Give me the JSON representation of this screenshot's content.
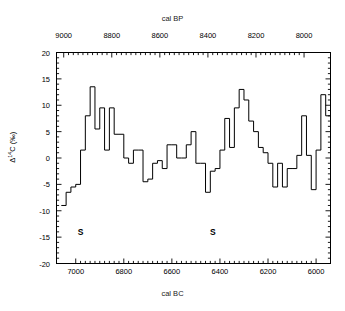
{
  "axes": {
    "top_label": "cal BP",
    "bottom_label": "cal BC",
    "y_label_prefix": "Δ",
    "y_label_sup": "14",
    "y_label_suffix": "C (‰)",
    "top_ticks": [
      "9000",
      "8800",
      "8600",
      "8400",
      "8200",
      "8000"
    ],
    "bottom_ticks": [
      "7000",
      "6800",
      "6600",
      "6400",
      "6200",
      "6000"
    ],
    "y_ticks": [
      "20",
      "15",
      "10",
      "5",
      "0",
      "-5",
      "-10",
      "-15",
      "-20"
    ]
  },
  "annotations": [
    {
      "text": "S",
      "x_cal_bc": 6980,
      "y": -14
    },
    {
      "text": "S",
      "x_cal_bc": 6430,
      "y": -14
    }
  ],
  "colors": {
    "line": "#000000",
    "axis": "#000000",
    "background": "#ffffff",
    "text": "#1a1a1a"
  },
  "chart_data": {
    "type": "line",
    "title": "",
    "subtitle": "",
    "xlabel": "cal BC",
    "xlabel_top": "cal BP",
    "ylabel": "Δ14C (‰)",
    "grid": false,
    "legend": null,
    "step": "post",
    "xlim_bottom": [
      7080,
      5940
    ],
    "xlim_top": [
      9030,
      7890
    ],
    "ylim": [
      -20,
      20
    ],
    "xtick_step": 200,
    "ytick_step": 5,
    "x_units": "calendar years BC (decreasing left to right)",
    "y_units": "per mil",
    "x": [
      7060,
      7040,
      7020,
      7000,
      6980,
      6960,
      6940,
      6920,
      6900,
      6880,
      6860,
      6840,
      6820,
      6800,
      6780,
      6760,
      6740,
      6720,
      6700,
      6680,
      6660,
      6640,
      6620,
      6600,
      6580,
      6560,
      6540,
      6520,
      6500,
      6480,
      6460,
      6440,
      6420,
      6400,
      6380,
      6360,
      6340,
      6320,
      6300,
      6280,
      6260,
      6240,
      6220,
      6200,
      6180,
      6160,
      6140,
      6120,
      6100,
      6080,
      6060,
      6040,
      6020,
      6000,
      5980,
      5960
    ],
    "values": [
      -9.0,
      -6.5,
      -5.5,
      -5.0,
      1.5,
      8.0,
      13.5,
      5.5,
      9.5,
      1.5,
      9.5,
      4.5,
      4.5,
      0.0,
      -1.0,
      1.5,
      1.5,
      -4.5,
      -4.0,
      -1.0,
      -0.5,
      -2.0,
      2.5,
      2.5,
      0.0,
      0.0,
      2.5,
      5.0,
      -1.0,
      -1.0,
      -6.5,
      -2.5,
      -2.0,
      1.5,
      7.5,
      2.0,
      9.5,
      13.0,
      11.0,
      7.0,
      5.0,
      2.0,
      1.0,
      -1.0,
      -5.5,
      -1.0,
      -5.5,
      -2.0,
      -2.0,
      0.5,
      8.0,
      0.5,
      -6.0,
      1.5,
      12.0,
      8.0
    ],
    "series": [
      {
        "name": "Δ14C",
        "values": [
          -9.0,
          -6.5,
          -5.5,
          -5.0,
          1.5,
          8.0,
          13.5,
          5.5,
          9.5,
          1.5,
          9.5,
          4.5,
          4.5,
          0.0,
          -1.0,
          1.5,
          1.5,
          -4.5,
          -4.0,
          -1.0,
          -0.5,
          -2.0,
          2.5,
          2.5,
          0.0,
          0.0,
          2.5,
          5.0,
          -1.0,
          -1.0,
          -6.5,
          -2.5,
          -2.0,
          1.5,
          7.5,
          2.0,
          9.5,
          13.0,
          11.0,
          7.0,
          5.0,
          2.0,
          1.0,
          -1.0,
          -5.5,
          -1.0,
          -5.5,
          -2.0,
          -2.0,
          0.5,
          8.0,
          0.5,
          -6.0,
          1.5,
          12.0,
          8.0
        ]
      }
    ],
    "annotations": [
      {
        "text": "S",
        "x": 6980,
        "y": -14
      },
      {
        "text": "S",
        "x": 6430,
        "y": -14
      }
    ]
  }
}
